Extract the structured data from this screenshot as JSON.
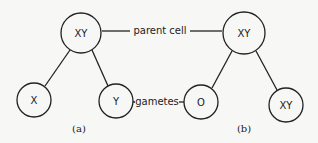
{
  "diagram": {
    "labels": {
      "parent_cell": "parent cell",
      "gametes": "gametes"
    },
    "panel_a": {
      "caption": "(a)",
      "parent": "XY",
      "gamete_left": "X",
      "gamete_right": "Y"
    },
    "panel_b": {
      "caption": "(b)",
      "parent": "XY",
      "gamete_left": "O",
      "gamete_right": "XY"
    }
  }
}
